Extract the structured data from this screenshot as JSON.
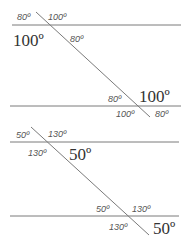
{
  "diagrams": [
    {
      "name": "parallel-lines-100-80",
      "labels": {
        "top_left": "80º",
        "top_right": "100º",
        "below_left_large": "100º",
        "below_right": "80º",
        "lower_above_left": "80º",
        "lower_above_right_large": "100º",
        "lower_below_left": "100º",
        "lower_below_right": "80º"
      }
    },
    {
      "name": "parallel-lines-50-130",
      "labels": {
        "top_left": "50º",
        "top_right": "130º",
        "below_left": "130º",
        "below_right_large": "50º",
        "lower_above_left": "50º",
        "lower_above_right": "130º",
        "lower_below_left": "130º",
        "lower_below_right_large": "50º"
      }
    }
  ],
  "colors": {
    "line": "#7a7a7a",
    "text": "#555555"
  }
}
